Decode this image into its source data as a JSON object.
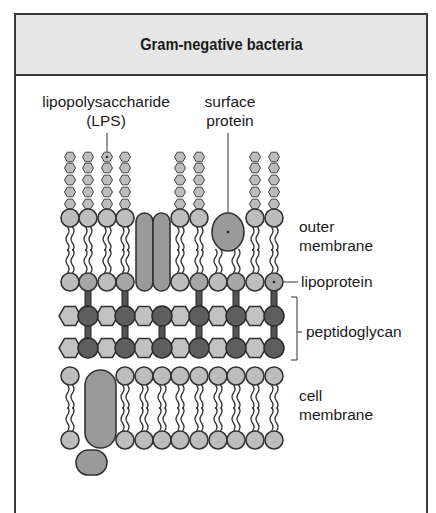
{
  "title": "Gram-negative bacteria",
  "labels": {
    "lps_line1": "lipopolysaccharide",
    "lps_line2": "(LPS)",
    "surface_line1": "surface",
    "surface_line2": "protein",
    "outer_line1": "outer",
    "outer_line2": "membrane",
    "lipoprotein": "lipoprotein",
    "peptidoglycan": "peptidoglycan",
    "cell_line1": "cell",
    "cell_line2": "membrane"
  },
  "colors": {
    "frame": "#3a3a3a",
    "header_bg": "#e6e6e6",
    "light_fill": "#bdbdbd",
    "medium_fill": "#9a9a9a",
    "dark_fill": "#5e5e5e",
    "outline": "#333333"
  },
  "structure": {
    "layers": [
      "lipopolysaccharide (LPS)",
      "outer membrane",
      "lipoprotein",
      "peptidoglycan",
      "cell membrane"
    ],
    "lps_chain_columns": 8,
    "sugar_units_per_chain": 5
  }
}
